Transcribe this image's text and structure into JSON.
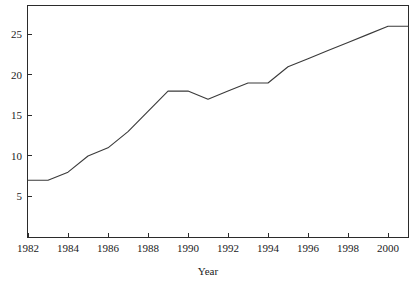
{
  "chart_data": {
    "type": "line",
    "title": "",
    "subtitle": "",
    "xlabel": "Year",
    "ylabel": "",
    "x": [
      1982,
      1983,
      1984,
      1985,
      1986,
      1987,
      1988,
      1989,
      1990,
      1991,
      1992,
      1993,
      1994,
      1995,
      1996,
      1997,
      1998,
      1999,
      2000,
      2001
    ],
    "values": [
      7,
      7,
      8,
      10,
      11,
      13,
      15.5,
      18,
      18,
      17,
      18,
      19,
      19,
      21,
      22,
      23,
      24,
      25,
      26,
      26
    ],
    "series": [
      {
        "name": "",
        "values": [
          7,
          7,
          8,
          10,
          11,
          13,
          15.5,
          18,
          18,
          17,
          18,
          19,
          19,
          21,
          22,
          23,
          24,
          25,
          26,
          26
        ]
      }
    ],
    "xlim": [
      1982,
      2001
    ],
    "ylim": [
      0,
      28.5
    ],
    "xticks": [
      1982,
      1984,
      1986,
      1988,
      1990,
      1992,
      1994,
      1996,
      1998,
      2000
    ],
    "xtick_labels": [
      "1982",
      "1984",
      "1986",
      "1988",
      "1990",
      "1992",
      "1994",
      "1996",
      "1998",
      "2000"
    ],
    "yticks": [
      5,
      10,
      15,
      20,
      25
    ],
    "ytick_labels": [
      "5",
      "10",
      "15",
      "20",
      "25"
    ],
    "grid": false,
    "legend": false,
    "legend_position": "none",
    "line_color": "#3a3a3a",
    "frame_color": "#2b2b2b",
    "background_color": "#ffffff",
    "annotations": []
  }
}
